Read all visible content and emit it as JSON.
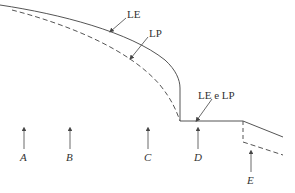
{
  "labels": {
    "le": "LE",
    "lp": "LP",
    "le_lp": "LE e LP"
  },
  "sections": [
    {
      "id": "A",
      "label": "A"
    },
    {
      "id": "B",
      "label": "B"
    },
    {
      "id": "C",
      "label": "C"
    },
    {
      "id": "D",
      "label": "D"
    },
    {
      "id": "E",
      "label": "E"
    }
  ],
  "colors": {
    "line": "#555555",
    "text": "#333333"
  }
}
